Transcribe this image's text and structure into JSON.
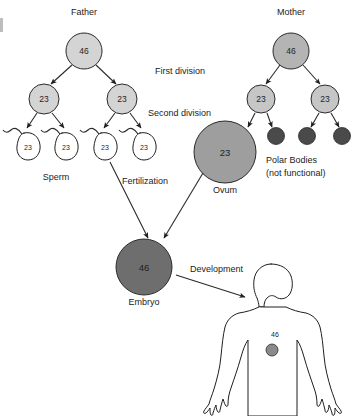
{
  "diagram": {
    "title_labels": {
      "father": "Father",
      "mother": "Mother"
    },
    "stage_labels": {
      "first_division": "First division",
      "second_division": "Second division",
      "fertilization": "Fertilization",
      "development": "Development"
    },
    "structure_labels": {
      "sperm": "Sperm",
      "ovum": "Ovum",
      "embryo": "Embryo",
      "polar_bodies_line1": "Polar Bodies",
      "polar_bodies_line2": "(not functional)"
    },
    "chromosome_counts": {
      "father_germ": "46",
      "mother_germ": "46",
      "father_secondary_left": "23",
      "father_secondary_right": "23",
      "mother_secondary_left": "23",
      "mother_secondary_right": "23",
      "sperm_1": "23",
      "sperm_2": "23",
      "sperm_3": "23",
      "sperm_4": "23",
      "ovum": "23",
      "embryo": "46",
      "adult_body": "46"
    },
    "colors": {
      "light_gray_cell": "#d4d4d4",
      "mid_gray_cell": "#9e9e9e",
      "dark_gray_cell": "#4a4a4a",
      "outline": "#2b2b2b",
      "text": "#1b1b1b",
      "background": "#ffffff"
    }
  }
}
